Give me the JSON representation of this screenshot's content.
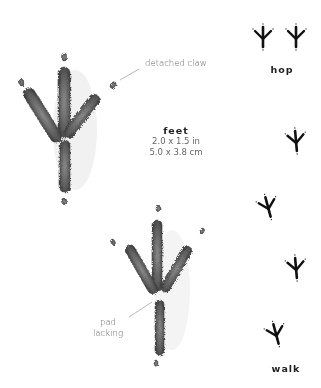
{
  "diagram": {
    "feet": {
      "title": "feet",
      "size_in": "2.0 x 1.5 in",
      "size_cm": "5.0 x 3.8 cm"
    },
    "annotations": {
      "detached_claw": "detached claw",
      "pad_lacking_line1": "pad",
      "pad_lacking_line2": "lacking"
    },
    "gaits": {
      "hop": "hop",
      "walk": "walk"
    },
    "colors": {
      "track_shading": "#6b6b6b",
      "track_dark": "#3a3a3a",
      "gait_print": "#111111",
      "label_text": "#666666",
      "title_text": "#222222"
    }
  }
}
